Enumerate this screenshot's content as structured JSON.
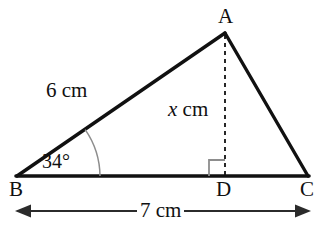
{
  "figure": {
    "type": "geometry-diagram",
    "shape": "triangle",
    "canvas": {
      "width": 327,
      "height": 233
    },
    "background_color": "#ffffff",
    "stroke_color": "#111111",
    "accent_color": "#8a8a8a"
  },
  "vertices": {
    "a": {
      "label": "A",
      "x": 225,
      "y": 33
    },
    "b": {
      "label": "B",
      "x": 17,
      "y": 176
    },
    "c": {
      "label": "C",
      "x": 308,
      "y": 176
    },
    "d": {
      "label": "D",
      "x": 225,
      "y": 176
    }
  },
  "labels": {
    "side_ba": "6 cm",
    "altitude_prefix": "x",
    "altitude_suffix": " cm",
    "angle_b": "34°",
    "dimension_bc": "7 cm"
  },
  "measurements": {
    "side_ba_value": 6,
    "side_ba_unit": "cm",
    "altitude_ad_value": "x",
    "altitude_ad_unit": "cm",
    "angle_b_degrees": 34,
    "base_bc_value": 7,
    "base_bc_unit": "cm",
    "angle_adb_degrees": 90
  },
  "marks": {
    "angle_arc_b": {
      "radius": 83,
      "start_deg": 0,
      "end_deg": 34,
      "color": "#8d8d8d"
    },
    "right_angle_d": {
      "size": 15,
      "color": "#8d8d8d"
    },
    "altitude_dash": {
      "dash": "4 4",
      "color": "#111111"
    },
    "dimension_line": {
      "y": 211,
      "x1": 17,
      "x2": 310,
      "color": "#2b2b2b",
      "arrows": "both"
    }
  }
}
